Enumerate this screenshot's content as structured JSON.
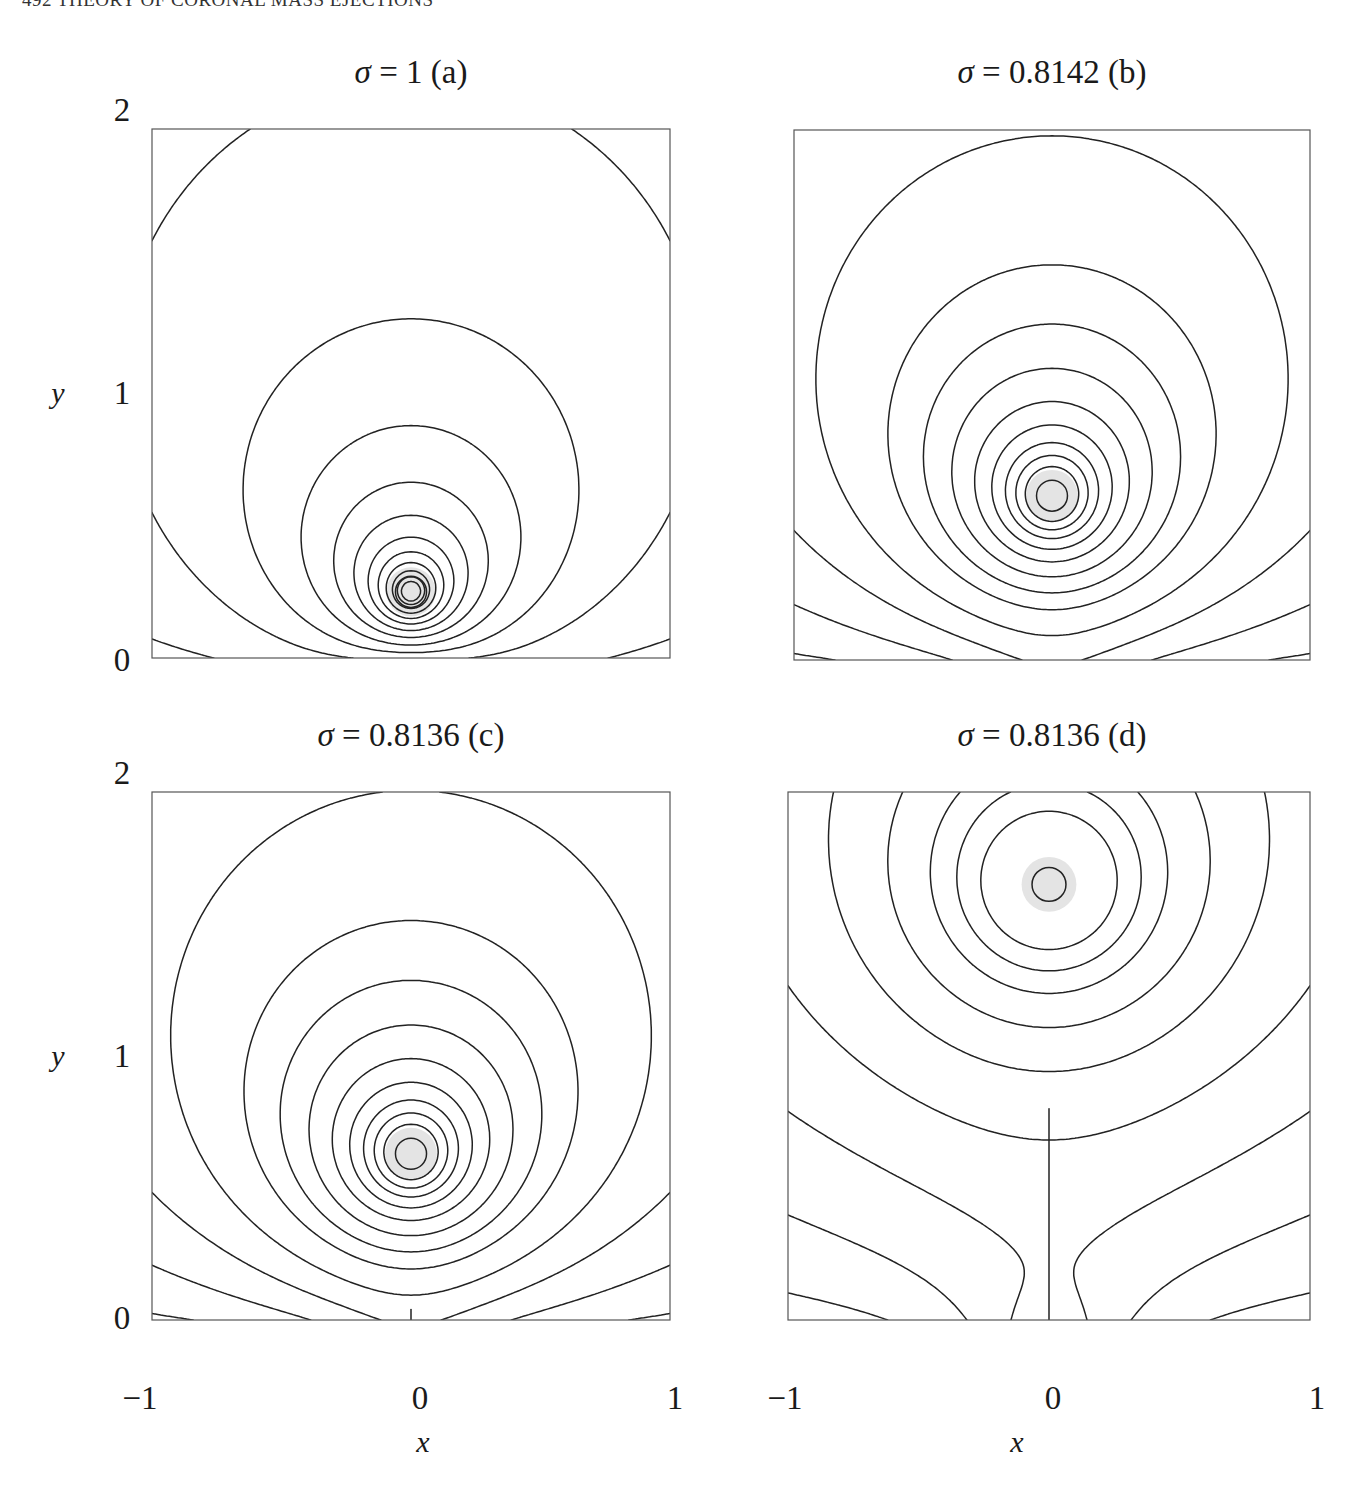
{
  "running_head": "492  THEORY OF CORONAL MASS EJECTIONS",
  "colors": {
    "line": "#222222",
    "frame": "#555555",
    "core_fill": "#e4e4e4",
    "background": "#ffffff"
  },
  "axes": {
    "x_label": "x",
    "y_label": "y",
    "x_ticks": [
      "−1",
      "0",
      "1"
    ],
    "y_ticks": [
      "0",
      "1",
      "2"
    ]
  },
  "panels": [
    {
      "id": "a",
      "title_sigma": "σ",
      "title_rest": " =  1  (a)"
    },
    {
      "id": "b",
      "title_sigma": "σ",
      "title_rest": "  =  0.8142  (b)"
    },
    {
      "id": "c",
      "title_sigma": "σ",
      "title_rest": " =  0.8136 (c)"
    },
    {
      "id": "d",
      "title_sigma": "σ",
      "title_rest": " =  0.8136  (d)"
    }
  ],
  "chart_data": [
    {
      "type": "contour",
      "title": "σ = 1 (a)",
      "xlabel": "x",
      "ylabel": "y",
      "xlim": [
        -1,
        1
      ],
      "ylim": [
        0,
        2
      ],
      "x_ticks": [
        -1,
        0,
        1
      ],
      "y_ticks": [
        0,
        1,
        2
      ],
      "grid": false,
      "sigma": 1,
      "flux_rope_center": [
        0,
        0.25
      ],
      "x_point": null,
      "description": "Nested field lines around a flux rope near the base; outer arcade lines anchored to y=0"
    },
    {
      "type": "contour",
      "title": "σ = 0.8142 (b)",
      "xlabel": "x",
      "ylabel": "y",
      "xlim": [
        -1,
        1
      ],
      "ylim": [
        0,
        2
      ],
      "x_ticks": [
        -1,
        0,
        1
      ],
      "y_ticks": [
        0,
        1,
        2
      ],
      "grid": false,
      "sigma": 0.8142,
      "flux_rope_center": [
        0,
        0.62
      ],
      "x_point": [
        0,
        0
      ],
      "description": "Flux rope lifted; separatrix touches surface at origin (bald patch / cusp)"
    },
    {
      "type": "contour",
      "title": "σ = 0.8136 (c)",
      "xlabel": "x",
      "ylabel": "y",
      "xlim": [
        -1,
        1
      ],
      "ylim": [
        0,
        2
      ],
      "x_ticks": [
        -1,
        0,
        1
      ],
      "y_ticks": [
        0,
        1,
        2
      ],
      "grid": false,
      "sigma": 0.8136,
      "flux_rope_center": [
        0,
        0.63
      ],
      "x_point": [
        0,
        0.04
      ],
      "description": "X-point appears just above the surface with short vertical current sheet"
    },
    {
      "type": "contour",
      "title": "σ = 0.8136 (d)",
      "xlabel": "x",
      "ylabel": "y",
      "xlim": [
        -1,
        1
      ],
      "ylim": [
        0,
        2
      ],
      "x_ticks": [
        -1,
        0,
        1
      ],
      "y_ticks": [
        0,
        1,
        2
      ],
      "grid": false,
      "sigma": 0.8136,
      "flux_rope_center": [
        0,
        1.65
      ],
      "x_point": [
        0,
        0.8
      ],
      "current_sheet": {
        "x": 0,
        "y_from": 0,
        "y_to": 0.8
      },
      "description": "Flux rope high at y≈1.65 with long vertical current sheet from y=0 to y≈0.8"
    }
  ],
  "layout": {
    "plots": [
      {
        "left": 152,
        "top": 129,
        "width": 518,
        "height": 529
      },
      {
        "left": 794,
        "top": 130,
        "width": 516,
        "height": 530
      },
      {
        "left": 152,
        "top": 792,
        "width": 518,
        "height": 528
      },
      {
        "left": 788,
        "top": 792,
        "width": 522,
        "height": 528
      }
    ]
  },
  "model": [
    {
      "h": 0.25,
      "I": 1.0,
      "D": 0.55,
      "d": 0.55,
      "sheet": 0,
      "levels": [
        0.12,
        0.3,
        0.5,
        0.72,
        0.95,
        1.18,
        1.42,
        1.66,
        1.92,
        2.2,
        2.5,
        2.85
      ],
      "core_r": 0.06,
      "shade_r": 0.095
    },
    {
      "h": 0.62,
      "I": 1.0,
      "D": 0.62,
      "d": 0.4,
      "sheet": 0,
      "levels": [
        0.1,
        0.28,
        0.5,
        0.74,
        1.0,
        1.2,
        1.42,
        1.66,
        1.9,
        2.15,
        2.4,
        2.7
      ],
      "core_r": 0.06,
      "shade_r": 0.1
    },
    {
      "h": 0.63,
      "I": 1.0,
      "D": 0.62,
      "d": 0.4,
      "sheet": 0.04,
      "levels": [
        0.1,
        0.28,
        0.5,
        0.74,
        1.0,
        1.2,
        1.42,
        1.66,
        1.9,
        2.15,
        2.4,
        2.7
      ],
      "core_r": 0.06,
      "shade_r": 0.1
    },
    {
      "h": 1.65,
      "I": 1.0,
      "D": 0.9,
      "d": 0.3,
      "sheet": 0.8,
      "levels": [
        0.2,
        0.5,
        0.85,
        1.2,
        1.55,
        1.85,
        2.15,
        2.4,
        2.7
      ],
      "core_r": 0.065,
      "shade_r": 0.105
    }
  ]
}
